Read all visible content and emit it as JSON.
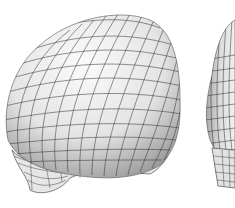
{
  "figure": {
    "models": [
      {
        "id": "left",
        "view": "three-quarter front",
        "grid_color": "#333333"
      },
      {
        "id": "right",
        "view": "side (partially cropped)",
        "grid_color": "#333333"
      }
    ],
    "colors": {
      "background": "#ffffff",
      "surface_light": "#f4f4f4",
      "surface_shadow": "#9a9a9a",
      "wire": "#2a2a2a"
    }
  }
}
